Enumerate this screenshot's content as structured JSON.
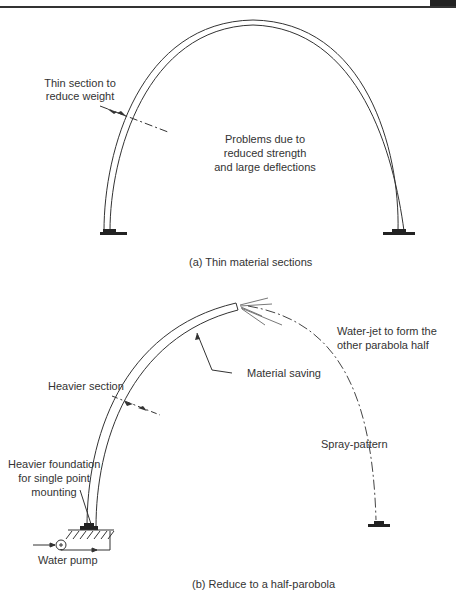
{
  "figure_a": {
    "labels": {
      "thin_section_line1": "Thin section to",
      "thin_section_line2": "reduce weight",
      "problems_line1": "Problems due to",
      "problems_line2": "reduced strength",
      "problems_line3": "and large deflections"
    },
    "caption": "(a) Thin material sections"
  },
  "figure_b": {
    "labels": {
      "water_jet_line1": "Water-jet to form the",
      "water_jet_line2": "other parabola half",
      "material_saving": "Material saving",
      "heavier_section": "Heavier section",
      "foundation_line1": "Heavier foundation",
      "foundation_line2": "for single point",
      "foundation_line3": "mounting",
      "spray_pattern": "Spray-pattern",
      "water_pump": "Water pump"
    },
    "caption": "(b) Reduce to a half-parobola"
  }
}
